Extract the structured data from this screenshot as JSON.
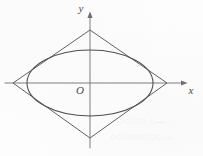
{
  "figure": {
    "type": "geometry-diagram",
    "background_color": "#fdfdfd",
    "stroke_color": "#555555",
    "axis_color": "#6b6b6b",
    "width": 203,
    "height": 156
  },
  "axes": {
    "origin_label": "O",
    "x_axis_label": "x",
    "y_axis_label": "y",
    "origin": {
      "x": 90,
      "y": 83
    },
    "x_axis": {
      "x_start": 5,
      "x_end": 187,
      "y": 83,
      "arrow": "right"
    },
    "y_axis": {
      "y_start": 148,
      "y_end": 12,
      "x": 90,
      "arrow": "up"
    }
  },
  "shapes": {
    "rhombus": {
      "name": "rhombus",
      "vertices": [
        {
          "x": 167,
          "y": 83
        },
        {
          "x": 90,
          "y": 30
        },
        {
          "x": 13,
          "y": 83
        },
        {
          "x": 90,
          "y": 138
        }
      ],
      "half_width": 77,
      "half_height": 54
    },
    "ellipse": {
      "name": "ellipse",
      "center": {
        "x": 90,
        "y": 83
      },
      "semi_major_axis_a": 63,
      "semi_minor_axis_b": 33
    }
  },
  "artifacts": {
    "bleed_through_line_1": "—◌ ◌◌◌◌◌",
    "bleed_through_line_2": "◌◌◌◌◌◌◌◌◌◌◌"
  }
}
